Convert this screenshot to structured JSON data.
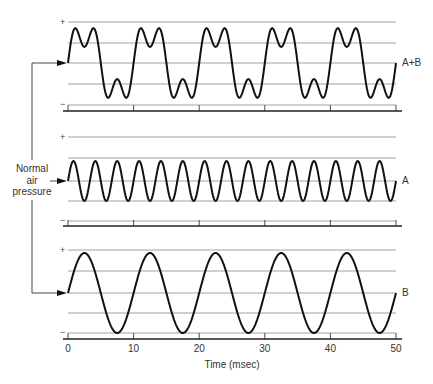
{
  "figure": {
    "side_label": [
      "Normal",
      "air",
      "pressure"
    ],
    "x_axis_label": "Time (msec)",
    "x_ticks": [
      "0",
      "10",
      "20",
      "30",
      "40",
      "50"
    ],
    "plus_sign": "+",
    "minus_sign": "−",
    "panels": [
      {
        "id": "sum",
        "label": "A+B"
      },
      {
        "id": "a",
        "label": "A"
      },
      {
        "id": "b",
        "label": "B"
      }
    ]
  },
  "chart_data": {
    "type": "line",
    "title": "",
    "xlabel": "Time (msec)",
    "x_range": [
      0,
      50
    ],
    "x_ticks": [
      0,
      10,
      20,
      30,
      40,
      50
    ],
    "series": [
      {
        "name": "A+B",
        "description": "sum of A and B",
        "formula": "sin(2*pi*t/10) + 0.5*sin(2*pi*t/(10/3))"
      },
      {
        "name": "A",
        "period_ms": 3.333,
        "frequency_hz": 300,
        "relative_amplitude": 0.5
      },
      {
        "name": "B",
        "period_ms": 10,
        "frequency_hz": 100,
        "relative_amplitude": 1.0
      }
    ],
    "y_reference": "Normal air pressure (baseline)",
    "y_markers": [
      "+",
      "−"
    ],
    "grid": true
  }
}
